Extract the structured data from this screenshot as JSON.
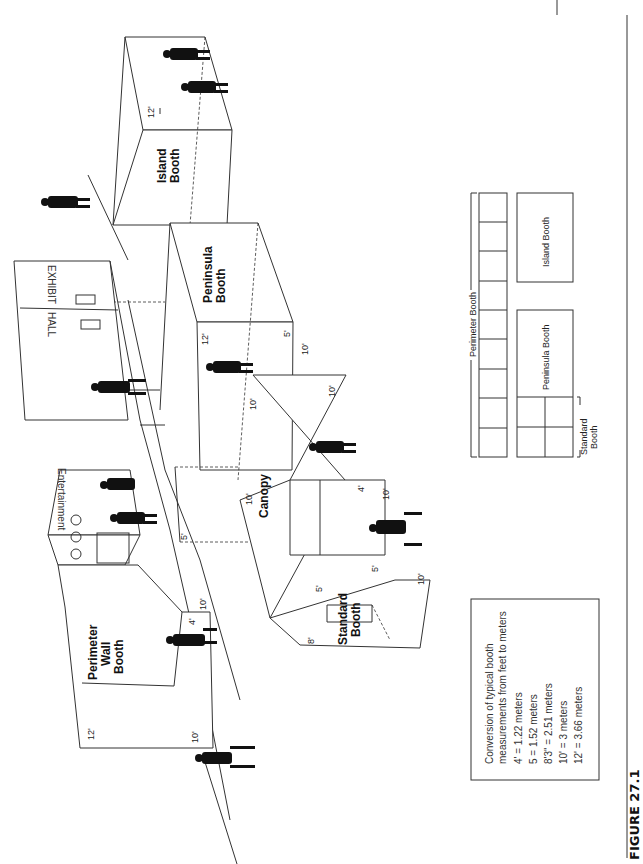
{
  "figure": {
    "caption": "FIGURE 27.1"
  },
  "drawing": {
    "booths": {
      "perimeter_wall": {
        "line1": "Perimeter",
        "line2": "Wall",
        "line3": "Booth"
      },
      "standard": {
        "line1": "Standard",
        "line2": "Booth"
      },
      "canopy": {
        "label": "Canopy"
      },
      "peninsula": {
        "line1": "Peninsula",
        "line2": "Booth"
      },
      "island": {
        "line1": "Island",
        "line2": "Booth"
      }
    },
    "walls": {
      "entertainment": "Entertainment",
      "exhibit_hall_1": "EXHIBIT",
      "exhibit_hall_2": "HALL"
    },
    "dimensions": {
      "perimeter_height": "12'",
      "perimeter_width": "10'",
      "perimeter_side": "4'",
      "perimeter_entry": "10'",
      "standard_height": "8'",
      "standard_side": "5'",
      "standard_width": "10'",
      "standard_gap": "5'",
      "canopy_a": "10'",
      "canopy_b": "10'",
      "canopy_c": "10'",
      "canopy_d": "10'",
      "canopy_side": "4'",
      "canopy_left": "5'",
      "peninsula_height": "12'",
      "peninsula_side": "5'",
      "peninsula_width": "10'",
      "island_height": "12'"
    }
  },
  "floorplan": {
    "perimeter_label": "Perimeter Booth",
    "perimeter_cells": 9,
    "peninsula_label": "Peninsula Booth",
    "island_label": "Island Booth",
    "standard_label_1": "Standard",
    "standard_label_2": "Booth"
  },
  "conversion": {
    "title_1": "Conversion of typical booth",
    "title_2": "measurements from feet to meters",
    "rows": [
      "4' = 1.22 meters",
      "5 = 1.52 meters",
      "8'3\" = 2.51 meters",
      "10' = 3 meters",
      "12' = 3.66 meters"
    ]
  }
}
